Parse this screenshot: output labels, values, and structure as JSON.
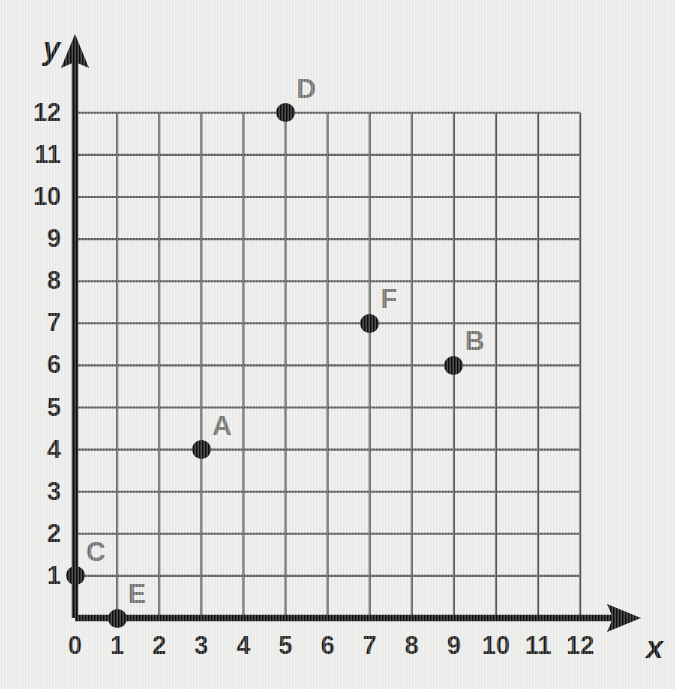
{
  "chart_data": {
    "type": "scatter",
    "title": "",
    "xlabel": "x",
    "ylabel": "y",
    "xlim": [
      0,
      12
    ],
    "ylim": [
      0,
      12
    ],
    "grid": true,
    "legend": "none",
    "x_ticks": [
      "0",
      "1",
      "2",
      "3",
      "4",
      "5",
      "6",
      "7",
      "8",
      "9",
      "10",
      "11",
      "12"
    ],
    "y_ticks": [
      "1",
      "2",
      "3",
      "4",
      "5",
      "6",
      "7",
      "8",
      "9",
      "10",
      "11",
      "12"
    ],
    "points": [
      {
        "label": "A",
        "x": 3,
        "y": 4
      },
      {
        "label": "B",
        "x": 9,
        "y": 6
      },
      {
        "label": "C",
        "x": 0,
        "y": 1
      },
      {
        "label": "D",
        "x": 5,
        "y": 12
      },
      {
        "label": "E",
        "x": 1,
        "y": 0
      },
      {
        "label": "F",
        "x": 7,
        "y": 7
      }
    ]
  },
  "colors": {
    "background": "#ececea",
    "gridline": "#555555",
    "axis": "#0d0d0d",
    "point": "#0d0d0d",
    "point_label": "#6e6e6e",
    "tick_label": "#1b1b1b"
  }
}
